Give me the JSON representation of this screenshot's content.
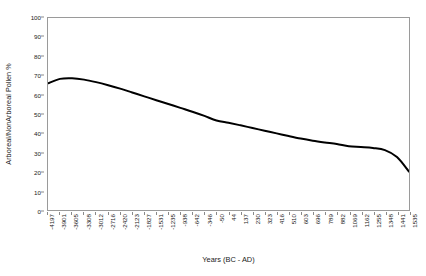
{
  "chart_data": {
    "type": "line",
    "title": "",
    "xlabel": "Years (BC - AD)",
    "ylabel": "Arboreal/NonArboreal Pollen %",
    "ylim": [
      0,
      100
    ],
    "ytick_values": [
      0,
      10,
      20,
      30,
      40,
      50,
      60,
      70,
      80,
      90,
      100
    ],
    "ytick_labels": [
      "0",
      "10",
      "20",
      "30",
      "40",
      "50",
      "60",
      "70",
      "80",
      "90",
      "100"
    ],
    "grid": false,
    "legend": false,
    "legend_position": "none",
    "line_color": "#000000",
    "line_width": 2.0,
    "categories": [
      "-4197",
      "-3901",
      "-3605",
      "-3308",
      "-3012",
      "-2716",
      "-2420",
      "-2123",
      "-1827",
      "-1531",
      "-1235",
      "-938",
      "-642",
      "-346",
      "-50",
      "44",
      "137",
      "230",
      "323",
      "416",
      "510",
      "603",
      "696",
      "789",
      "882",
      "1069",
      "1162",
      "1255",
      "1348",
      "1441",
      "1535"
    ],
    "values": [
      66.0,
      68.3,
      68.6,
      67.9,
      66.6,
      65.0,
      63.2,
      61.2,
      59.2,
      57.2,
      55.2,
      53.2,
      51.2,
      49.0,
      46.6,
      45.4,
      44.1,
      42.7,
      41.3,
      39.9,
      38.5,
      37.2,
      36.1,
      35.2,
      34.4,
      33.2,
      32.8,
      32.3,
      31.2,
      27.6,
      20.0
    ]
  }
}
